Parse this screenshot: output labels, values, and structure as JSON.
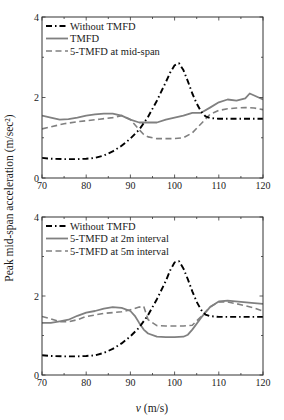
{
  "figure": {
    "ylabel": "Peak mid-span acceleration (m/sec²)",
    "xlabel_var": "v",
    "xlabel_unit": "(m/s)"
  },
  "chart_data": [
    {
      "type": "line",
      "title": "",
      "xlabel": "v (m/s)",
      "ylabel": "Peak mid-span acceleration (m/sec^2)",
      "xlim": [
        70,
        120
      ],
      "ylim": [
        0,
        4
      ],
      "xticks": [
        70,
        80,
        90,
        100,
        110,
        120
      ],
      "yticks": [
        0,
        2,
        4
      ],
      "grid": false,
      "legend_position": "upper left",
      "series": [
        {
          "name": "Without TMFD",
          "style": "dashdot",
          "color": "#000000",
          "x": [
            70,
            72,
            75,
            78,
            80,
            82,
            84,
            86,
            88,
            90,
            92,
            94,
            96,
            98,
            99,
            100,
            101,
            102,
            103,
            104,
            105,
            106,
            107,
            108,
            110,
            115,
            120
          ],
          "y": [
            0.5,
            0.48,
            0.47,
            0.47,
            0.48,
            0.5,
            0.56,
            0.66,
            0.8,
            0.98,
            1.2,
            1.52,
            1.92,
            2.38,
            2.62,
            2.8,
            2.85,
            2.68,
            2.4,
            2.1,
            1.85,
            1.65,
            1.53,
            1.49,
            1.47,
            1.47,
            1.47
          ]
        },
        {
          "name": "TMFD",
          "style": "solid",
          "color": "#808080",
          "x": [
            70,
            72,
            74,
            76,
            78,
            80,
            82,
            84,
            86,
            88,
            90,
            92,
            94,
            96,
            98,
            100,
            102,
            104,
            106,
            108,
            110,
            112,
            114,
            116,
            117,
            118,
            120
          ],
          "y": [
            1.55,
            1.5,
            1.45,
            1.46,
            1.5,
            1.55,
            1.58,
            1.6,
            1.6,
            1.55,
            1.45,
            1.38,
            1.38,
            1.38,
            1.45,
            1.5,
            1.55,
            1.62,
            1.62,
            1.75,
            1.88,
            1.95,
            1.92,
            1.98,
            2.1,
            2.05,
            1.95
          ]
        },
        {
          "name": "5-TMFD at mid-span",
          "style": "dashed",
          "color": "#808080",
          "x": [
            70,
            72,
            75,
            78,
            80,
            83,
            86,
            88,
            90,
            92,
            93,
            94,
            96,
            98,
            100,
            102,
            104,
            106,
            108,
            110,
            112,
            114,
            116,
            118,
            120
          ],
          "y": [
            1.22,
            1.27,
            1.35,
            1.4,
            1.42,
            1.46,
            1.5,
            1.55,
            1.45,
            1.2,
            1.08,
            1.02,
            0.98,
            0.98,
            0.98,
            1.0,
            1.12,
            1.35,
            1.58,
            1.68,
            1.72,
            1.74,
            1.75,
            1.74,
            1.7
          ]
        }
      ]
    },
    {
      "type": "line",
      "title": "",
      "xlabel": "v (m/s)",
      "ylabel": "Peak mid-span acceleration (m/sec^2)",
      "xlim": [
        70,
        120
      ],
      "ylim": [
        0,
        4
      ],
      "xticks": [
        70,
        80,
        90,
        100,
        110,
        120
      ],
      "yticks": [
        0,
        2,
        4
      ],
      "grid": false,
      "legend_position": "upper left",
      "series": [
        {
          "name": "Without TMFD",
          "style": "dashdot",
          "color": "#000000",
          "x": [
            70,
            72,
            75,
            78,
            80,
            82,
            84,
            86,
            88,
            90,
            92,
            94,
            96,
            98,
            99,
            100,
            101,
            102,
            103,
            104,
            105,
            106,
            107,
            108,
            110,
            115,
            120
          ],
          "y": [
            0.5,
            0.48,
            0.47,
            0.47,
            0.48,
            0.5,
            0.56,
            0.66,
            0.8,
            0.98,
            1.2,
            1.52,
            1.92,
            2.38,
            2.65,
            2.85,
            2.88,
            2.7,
            2.42,
            2.12,
            1.85,
            1.65,
            1.53,
            1.49,
            1.47,
            1.47,
            1.47
          ]
        },
        {
          "name": "5-TMFD at 2m interval",
          "style": "solid",
          "color": "#808080",
          "x": [
            70,
            72,
            74,
            76,
            78,
            80,
            82,
            84,
            86,
            88,
            90,
            91,
            92,
            93,
            94,
            96,
            98,
            100,
            102,
            103,
            104,
            106,
            108,
            110,
            112,
            115,
            118,
            120
          ],
          "y": [
            1.32,
            1.32,
            1.36,
            1.4,
            1.5,
            1.58,
            1.62,
            1.68,
            1.72,
            1.7,
            1.62,
            1.5,
            1.32,
            1.15,
            1.05,
            0.97,
            0.96,
            0.96,
            0.97,
            1.02,
            1.15,
            1.45,
            1.72,
            1.86,
            1.88,
            1.85,
            1.82,
            1.8
          ]
        },
        {
          "name": "5-TMFD at 5m interval",
          "style": "dashed",
          "color": "#808080",
          "x": [
            70,
            72,
            74,
            76,
            78,
            80,
            82,
            84,
            86,
            88,
            90,
            92,
            93,
            94,
            96,
            98,
            100,
            102,
            104,
            106,
            108,
            110,
            112,
            115,
            118,
            120
          ],
          "y": [
            1.48,
            1.42,
            1.35,
            1.35,
            1.4,
            1.48,
            1.52,
            1.56,
            1.58,
            1.6,
            1.65,
            1.72,
            1.74,
            1.4,
            1.25,
            1.24,
            1.24,
            1.24,
            1.26,
            1.48,
            1.72,
            1.85,
            1.85,
            1.78,
            1.7,
            1.62
          ]
        }
      ]
    }
  ]
}
